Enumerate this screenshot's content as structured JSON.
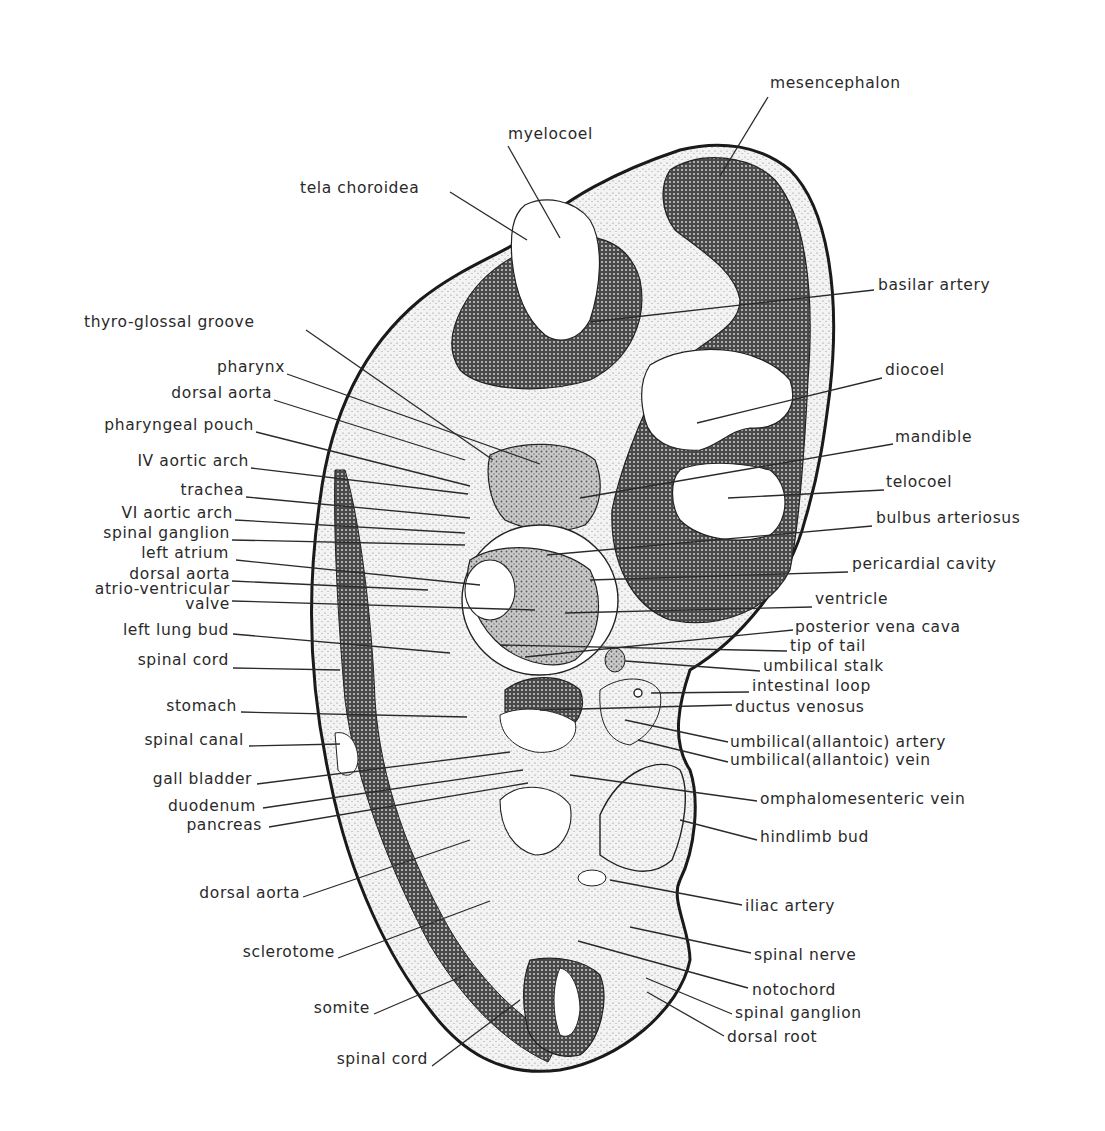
{
  "figure": {
    "type": "anatomical section drawing",
    "colors": {
      "ink": "#1a1a1a",
      "paper": "#ffffff",
      "dense_tissue": "#3a3a3a",
      "light_tissue": "#d8d8d8",
      "mid_tissue": "#9a9a9a"
    }
  },
  "labels_left": [
    {
      "text": "tela choroidea",
      "x": 300,
      "y": 193,
      "anchor": "start",
      "tx": 527,
      "ty": 240,
      "lx": 450,
      "ly": 192
    },
    {
      "text": "thyro-glossal groove",
      "x": 84,
      "y": 327,
      "anchor": "start",
      "tx": 493,
      "ty": 460,
      "lx": 306,
      "ly": 330
    },
    {
      "text": "pharynx",
      "x": 285,
      "y": 372,
      "anchor": "end",
      "tx": 540,
      "ty": 464,
      "lx": 287,
      "ly": 374
    },
    {
      "text": "dorsal aorta",
      "x": 272,
      "y": 398,
      "anchor": "end",
      "tx": 465,
      "ty": 460,
      "lx": 274,
      "ly": 400
    },
    {
      "text": "pharyngeal pouch",
      "x": 254,
      "y": 430,
      "anchor": "end",
      "tx": 470,
      "ty": 486,
      "lx": 256,
      "ly": 432
    },
    {
      "text": "IV aortic arch",
      "x": 249,
      "y": 466,
      "anchor": "end",
      "tx": 468,
      "ty": 494,
      "lx": 251,
      "ly": 468
    },
    {
      "text": "trachea",
      "x": 244,
      "y": 495,
      "anchor": "end",
      "tx": 470,
      "ty": 518,
      "lx": 246,
      "ly": 497
    },
    {
      "text": "VI aortic arch",
      "x": 233,
      "y": 518,
      "anchor": "end",
      "tx": 465,
      "ty": 533,
      "lx": 235,
      "ly": 520
    },
    {
      "text": "spinal ganglion",
      "x": 230,
      "y": 538,
      "anchor": "end",
      "tx": 465,
      "ty": 545,
      "lx": 232,
      "ly": 540
    },
    {
      "text": "left atrium",
      "x": 229,
      "y": 558,
      "anchor": "end",
      "tx": 480,
      "ty": 585,
      "lx": 236,
      "ly": 560
    },
    {
      "text": "dorsal aorta",
      "x": 230,
      "y": 579,
      "anchor": "end",
      "tx": 428,
      "ty": 590,
      "lx": 232,
      "ly": 581
    },
    {
      "text": "atrio-ventricular",
      "x": 230,
      "y": 594,
      "anchor": "end",
      "tx": null,
      "ty": null,
      "lx": null,
      "ly": null
    },
    {
      "text": "valve",
      "x": 230,
      "y": 609,
      "anchor": "end",
      "tx": 535,
      "ty": 610,
      "lx": 232,
      "ly": 601
    },
    {
      "text": "left lung bud",
      "x": 229,
      "y": 635,
      "anchor": "end",
      "tx": 450,
      "ty": 653,
      "lx": 233,
      "ly": 634
    },
    {
      "text": "spinal cord",
      "x": 229,
      "y": 665,
      "anchor": "end",
      "tx": 340,
      "ty": 670,
      "lx": 233,
      "ly": 668
    },
    {
      "text": "stomach",
      "x": 237,
      "y": 711,
      "anchor": "end",
      "tx": 467,
      "ty": 717,
      "lx": 241,
      "ly": 712
    },
    {
      "text": "spinal canal",
      "x": 244,
      "y": 745,
      "anchor": "end",
      "tx": 340,
      "ty": 744,
      "lx": 249,
      "ly": 746
    },
    {
      "text": "gall bladder",
      "x": 252,
      "y": 784,
      "anchor": "end",
      "tx": 510,
      "ty": 752,
      "lx": 257,
      "ly": 784
    },
    {
      "text": "duodenum",
      "x": 256,
      "y": 811,
      "anchor": "end",
      "tx": 523,
      "ty": 770,
      "lx": 263,
      "ly": 808
    },
    {
      "text": "pancreas",
      "x": 262,
      "y": 830,
      "anchor": "end",
      "tx": 528,
      "ty": 783,
      "lx": 269,
      "ly": 827
    },
    {
      "text": "dorsal aorta",
      "x": 300,
      "y": 898,
      "anchor": "end",
      "tx": 470,
      "ty": 840,
      "lx": 303,
      "ly": 897
    },
    {
      "text": "sclerotome",
      "x": 335,
      "y": 957,
      "anchor": "end",
      "tx": 490,
      "ty": 901,
      "lx": 338,
      "ly": 958
    },
    {
      "text": "somite",
      "x": 370,
      "y": 1013,
      "anchor": "end",
      "tx": 465,
      "ty": 975,
      "lx": 374,
      "ly": 1014
    },
    {
      "text": "spinal cord",
      "x": 428,
      "y": 1064,
      "anchor": "end",
      "tx": 520,
      "ty": 1000,
      "lx": 432,
      "ly": 1066
    }
  ],
  "labels_right": [
    {
      "text": "mesencephalon",
      "x": 770,
      "y": 88,
      "anchor": "start",
      "tx": 720,
      "ty": 176,
      "lx": 768,
      "ly": 97
    },
    {
      "text": "myelocoel",
      "x": 508,
      "y": 139,
      "anchor": "start",
      "tx": 560,
      "ty": 238,
      "lx": 508,
      "ly": 146
    },
    {
      "text": "basilar artery",
      "x": 878,
      "y": 290,
      "anchor": "start",
      "tx": 590,
      "ty": 322,
      "lx": 874,
      "ly": 290
    },
    {
      "text": "diocoel",
      "x": 885,
      "y": 375,
      "anchor": "start",
      "tx": 697,
      "ty": 423,
      "lx": 882,
      "ly": 378
    },
    {
      "text": "mandible",
      "x": 895,
      "y": 442,
      "anchor": "start",
      "tx": 580,
      "ty": 498,
      "lx": 893,
      "ly": 444
    },
    {
      "text": "telocoel",
      "x": 886,
      "y": 487,
      "anchor": "start",
      "tx": 728,
      "ty": 498,
      "lx": 884,
      "ly": 490
    },
    {
      "text": "bulbus arteriosus",
      "x": 876,
      "y": 523,
      "anchor": "start",
      "tx": 547,
      "ty": 555,
      "lx": 872,
      "ly": 526
    },
    {
      "text": "pericardial cavity",
      "x": 852,
      "y": 569,
      "anchor": "start",
      "tx": 590,
      "ty": 580,
      "lx": 848,
      "ly": 572
    },
    {
      "text": "ventricle",
      "x": 815,
      "y": 604,
      "anchor": "start",
      "tx": 565,
      "ty": 613,
      "lx": 812,
      "ly": 607
    },
    {
      "text": "posterior vena cava",
      "x": 795,
      "y": 632,
      "anchor": "start",
      "tx": 525,
      "ty": 657,
      "lx": 793,
      "ly": 630
    },
    {
      "text": "tip of tail",
      "x": 790,
      "y": 651,
      "anchor": "start",
      "tx": 500,
      "ty": 645,
      "lx": 787,
      "ly": 651
    },
    {
      "text": "umbilical stalk",
      "x": 763,
      "y": 671,
      "anchor": "start",
      "tx": 625,
      "ty": 661,
      "lx": 760,
      "ly": 671
    },
    {
      "text": "intestinal loop",
      "x": 752,
      "y": 691,
      "anchor": "start",
      "tx": 651,
      "ty": 693,
      "lx": 749,
      "ly": 692
    },
    {
      "text": "ductus venosus",
      "x": 735,
      "y": 712,
      "anchor": "start",
      "tx": 540,
      "ty": 710,
      "lx": 732,
      "ly": 705
    },
    {
      "text": "umbilical(allantoic) artery",
      "x": 730,
      "y": 747,
      "anchor": "start",
      "tx": 625,
      "ty": 720,
      "lx": 728,
      "ly": 742
    },
    {
      "text": "umbilical(allantoic) vein",
      "x": 730,
      "y": 765,
      "anchor": "start",
      "tx": 638,
      "ty": 740,
      "lx": 728,
      "ly": 762
    },
    {
      "text": "omphalomesenteric vein",
      "x": 760,
      "y": 804,
      "anchor": "start",
      "tx": 570,
      "ty": 775,
      "lx": 757,
      "ly": 801
    },
    {
      "text": "hindlimb bud",
      "x": 760,
      "y": 842,
      "anchor": "start",
      "tx": 680,
      "ty": 820,
      "lx": 757,
      "ly": 840
    },
    {
      "text": "iliac artery",
      "x": 745,
      "y": 911,
      "anchor": "start",
      "tx": 610,
      "ty": 880,
      "lx": 742,
      "ly": 905
    },
    {
      "text": "spinal nerve",
      "x": 754,
      "y": 960,
      "anchor": "start",
      "tx": 630,
      "ty": 927,
      "lx": 751,
      "ly": 953
    },
    {
      "text": "notochord",
      "x": 752,
      "y": 995,
      "anchor": "start",
      "tx": 578,
      "ty": 941,
      "lx": 748,
      "ly": 988
    },
    {
      "text": "spinal ganglion",
      "x": 735,
      "y": 1018,
      "anchor": "start",
      "tx": 646,
      "ty": 978,
      "lx": 732,
      "ly": 1014
    },
    {
      "text": "dorsal root",
      "x": 727,
      "y": 1042,
      "anchor": "start",
      "tx": 647,
      "ty": 992,
      "lx": 724,
      "ly": 1036
    }
  ]
}
